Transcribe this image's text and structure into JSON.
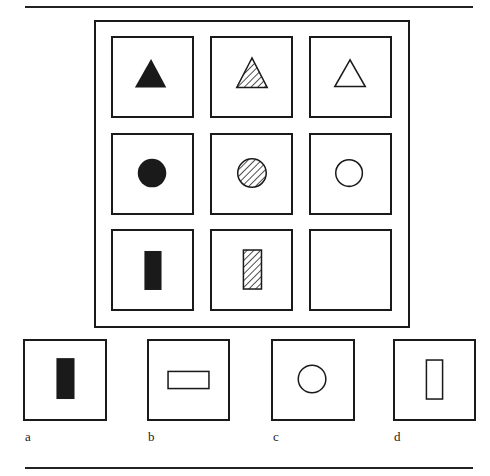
{
  "puzzle": {
    "description": "3x3 matrix reasoning puzzle: rows = shape, columns = fill",
    "matrix": {
      "rows": [
        [
          {
            "shape": "triangle",
            "fill": "solid"
          },
          {
            "shape": "triangle",
            "fill": "hatched"
          },
          {
            "shape": "triangle",
            "fill": "outline"
          }
        ],
        [
          {
            "shape": "circle",
            "fill": "solid"
          },
          {
            "shape": "circle",
            "fill": "hatched"
          },
          {
            "shape": "circle",
            "fill": "outline"
          }
        ],
        [
          {
            "shape": "vertical-rectangle",
            "fill": "solid"
          },
          {
            "shape": "vertical-rectangle",
            "fill": "hatched"
          },
          {
            "shape": "empty",
            "fill": "none"
          }
        ]
      ]
    },
    "options": [
      {
        "label": "a",
        "shape": "vertical-rectangle",
        "fill": "solid"
      },
      {
        "label": "b",
        "shape": "horizontal-rectangle",
        "fill": "outline"
      },
      {
        "label": "c",
        "shape": "circle",
        "fill": "outline"
      },
      {
        "label": "d",
        "shape": "vertical-rectangle",
        "fill": "outline"
      }
    ]
  },
  "colors": {
    "ink": "#1a1a1a",
    "paper": "#ffffff"
  }
}
